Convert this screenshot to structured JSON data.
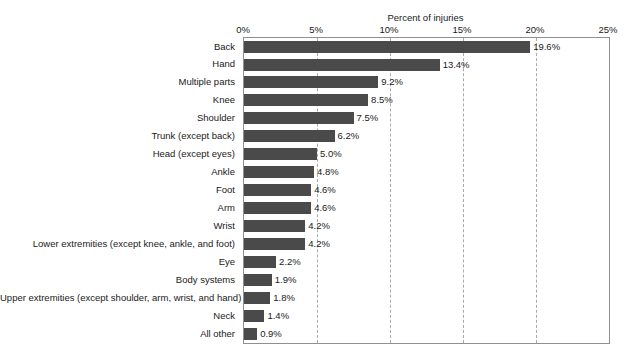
{
  "figure": {
    "clipped_title_fragment": "",
    "axis_title": "Percent of injuries"
  },
  "chart_data": {
    "type": "bar",
    "orientation": "horizontal",
    "title": "",
    "xlabel": "Percent of injuries",
    "ylabel": "",
    "xlim": [
      0,
      25
    ],
    "xticks": [
      0,
      5,
      10,
      15,
      20,
      25
    ],
    "xtick_labels": [
      "0%",
      "5%",
      "10%",
      "15%",
      "20%",
      "25%"
    ],
    "grid": "vertical-dashed",
    "legend": "none",
    "bar_color": "#4a4a4a",
    "categories": [
      "Back",
      "Hand",
      "Multiple parts",
      "Knee",
      "Shoulder",
      "Trunk (except back)",
      "Head (except eyes)",
      "Ankle",
      "Foot",
      "Arm",
      "Wrist",
      "Lower extremities (except knee, ankle, and foot)",
      "Eye",
      "Body systems",
      "Upper extremities (except shoulder, arm, wrist, and hand)",
      "Neck",
      "All other"
    ],
    "values": [
      19.6,
      13.4,
      9.2,
      8.5,
      7.5,
      6.2,
      5.0,
      4.8,
      4.6,
      4.6,
      4.2,
      4.2,
      2.2,
      1.9,
      1.8,
      1.4,
      0.9
    ],
    "value_labels": [
      "19.6%",
      "13.4%",
      "9.2%",
      "8.5%",
      "7.5%",
      "6.2%",
      "5.0%",
      "4.8%",
      "4.6%",
      "4.6%",
      "4.2%",
      "4.2%",
      "2.2%",
      "1.9%",
      "1.8%",
      "1.4%",
      "0.9%"
    ]
  }
}
